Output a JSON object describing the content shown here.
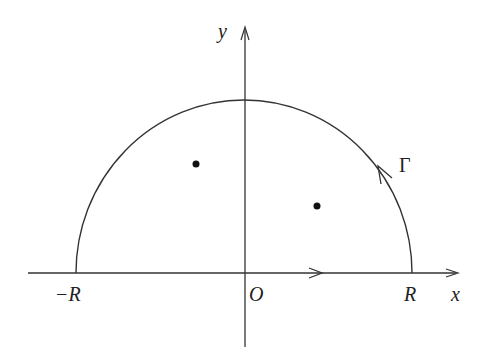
{
  "diagram": {
    "axes": {
      "x_label": "x",
      "y_label": "y",
      "origin_label": "O"
    },
    "endpoints": {
      "left_label": "−R",
      "right_label": "R"
    },
    "contour": {
      "arc_label": "Γ",
      "direction": "counterclockwise"
    },
    "points": [
      {
        "name": "singular-point-1",
        "x": 196,
        "y": 164
      },
      {
        "name": "singular-point-2",
        "x": 317,
        "y": 206
      }
    ],
    "colors": {
      "stroke": "#333333",
      "text": "#222222",
      "background": "#ffffff"
    }
  }
}
